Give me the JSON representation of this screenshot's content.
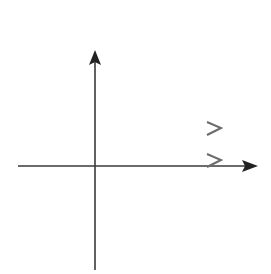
{
  "problem": {
    "number": "19."
  },
  "chart_data": {
    "type": "line",
    "title": "",
    "xlabel": "x",
    "ylabel": "y",
    "grid": true,
    "xlim": [
      -4,
      8
    ],
    "ylim": [
      -6,
      6
    ],
    "tick_labels": {
      "origin": "0",
      "x": [
        {
          "value": 3,
          "label": "3"
        }
      ],
      "y": [
        {
          "value": 2,
          "label": "2"
        }
      ]
    },
    "series": [
      {
        "name": "sideways parabola (opens right), vertex (3, 2)",
        "x": [
          8,
          6,
          4.5,
          3.5,
          3,
          3.5,
          4.5,
          6,
          8
        ],
        "y": [
          4,
          3.7,
          3.35,
          2.8,
          2,
          1.2,
          0.65,
          0.3,
          0
        ],
        "vertex": [
          3,
          2
        ],
        "arrows_at_ends": true
      }
    ]
  },
  "colors": {
    "curve": "#6b6b6b",
    "axis": "#3a3a3a",
    "grid": "#9a9a9a"
  }
}
